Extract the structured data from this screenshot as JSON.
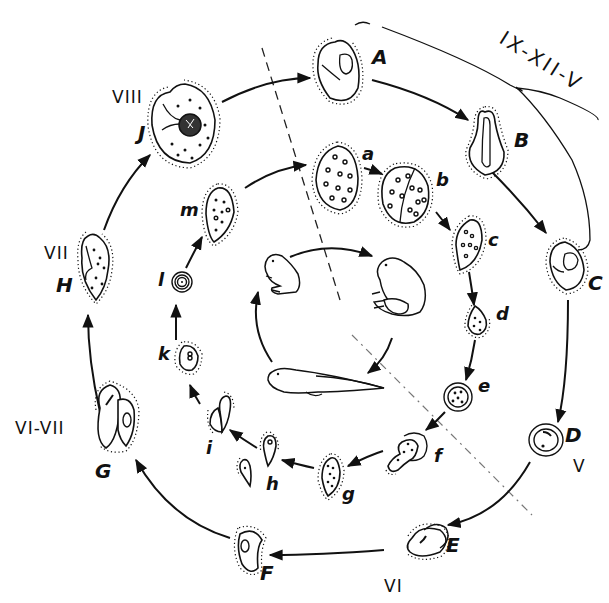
{
  "diagram": {
    "type": "life-cycle",
    "season_bracket_label": "IX-XII-V",
    "outer_cycle": {
      "stages": [
        {
          "id": "A",
          "label": "A",
          "month": ""
        },
        {
          "id": "B",
          "label": "B",
          "month": ""
        },
        {
          "id": "C",
          "label": "C",
          "month": ""
        },
        {
          "id": "D",
          "label": "D",
          "month": "V"
        },
        {
          "id": "E",
          "label": "E",
          "month": "VI"
        },
        {
          "id": "F",
          "label": "F",
          "month": ""
        },
        {
          "id": "G",
          "label": "G",
          "month": "VI-VII"
        },
        {
          "id": "H",
          "label": "H",
          "month": "VII"
        },
        {
          "id": "J",
          "label": "J",
          "month": "VIII"
        }
      ],
      "direction": "clockwise"
    },
    "inner_cycle": {
      "stages": [
        {
          "id": "a",
          "label": "a"
        },
        {
          "id": "b",
          "label": "b"
        },
        {
          "id": "c",
          "label": "c"
        },
        {
          "id": "d",
          "label": "d"
        },
        {
          "id": "e",
          "label": "e"
        },
        {
          "id": "f",
          "label": "f"
        },
        {
          "id": "g",
          "label": "g"
        },
        {
          "id": "h",
          "label": "h"
        },
        {
          "id": "i",
          "label": "i"
        },
        {
          "id": "k",
          "label": "k"
        },
        {
          "id": "l",
          "label": "l"
        },
        {
          "id": "m",
          "label": "m"
        }
      ],
      "direction": "clockwise"
    },
    "host_cycle": {
      "stages": [
        "small frog",
        "adult frog",
        "tadpole"
      ],
      "direction": "clockwise"
    },
    "separators": [
      {
        "style": "dashed",
        "from": "top-center",
        "to": "center"
      },
      {
        "style": "dash-dot",
        "from": "center",
        "to": "lower-right"
      }
    ]
  }
}
